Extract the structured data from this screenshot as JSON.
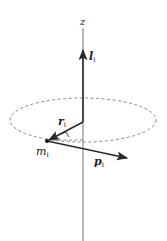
{
  "diagram": {
    "labels": {
      "axis": "z",
      "angular_momentum": "l",
      "angular_momentum_sub": "i",
      "position": "r",
      "position_sub": "i",
      "mass": "m",
      "mass_sub": "i",
      "momentum": "p",
      "momentum_sub": "i"
    },
    "colors": {
      "axis": "#8a8a8a",
      "vector": "#2a2a2a",
      "dashed": "#7a7a7a",
      "text": "#222222"
    }
  }
}
